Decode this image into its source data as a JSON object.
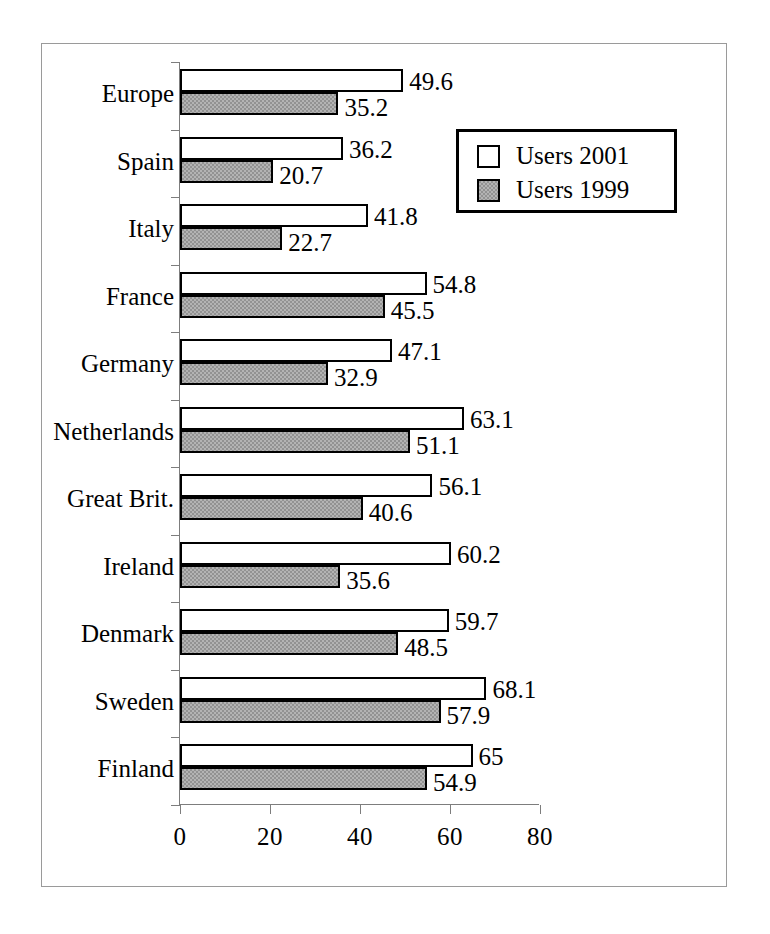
{
  "chart_data": {
    "type": "bar",
    "orientation": "horizontal",
    "title": "",
    "subtitle": "",
    "xlabel": "",
    "ylabel": "",
    "xlim": [
      0,
      80
    ],
    "xticks": [
      "0",
      "20",
      "40",
      "60",
      "80"
    ],
    "grid": false,
    "legend_position": "upper-right-inside",
    "categories": [
      "Europe",
      "Spain",
      "Italy",
      "France",
      "Germany",
      "Netherlands",
      "Great Brit.",
      "Ireland",
      "Denmark",
      "Sweden",
      "Finland"
    ],
    "series": [
      {
        "name": "Users 2001",
        "fill": "#ffffff",
        "values": [
          49.6,
          36.2,
          41.8,
          54.8,
          47.1,
          63.1,
          56.1,
          60.2,
          59.7,
          68.1,
          65
        ],
        "labels": [
          "49.6",
          "36.2",
          "41.8",
          "54.8",
          "47.1",
          "63.1",
          "56.1",
          "60.2",
          "59.7",
          "68.1",
          "65"
        ]
      },
      {
        "name": "Users 1999",
        "fill": "#929292",
        "values": [
          35.2,
          20.7,
          22.7,
          45.5,
          32.9,
          51.1,
          40.6,
          35.6,
          48.5,
          57.9,
          54.9
        ],
        "labels": [
          "35.2",
          "20.7",
          "22.7",
          "45.5",
          "32.9",
          "51.1",
          "40.6",
          "35.6",
          "48.5",
          "57.9",
          "54.9"
        ]
      }
    ]
  },
  "legend": {
    "items": [
      {
        "label": "Users 2001",
        "swatch": "series-a"
      },
      {
        "label": "Users 1999",
        "swatch": "series-b"
      }
    ]
  },
  "axis": {
    "x_tick_labels": [
      "0",
      "20",
      "40",
      "60",
      "80"
    ]
  }
}
